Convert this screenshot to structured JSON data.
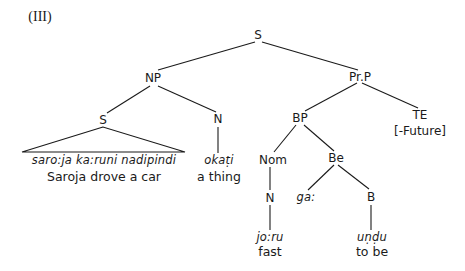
{
  "figure": {
    "label": "(III)",
    "line_color": "#1a1a1a",
    "background": "#ffffff"
  },
  "nodes": {
    "root_s": "S",
    "np": "NP",
    "prp": "Pr.P",
    "sub_s": "S",
    "n_np": "N",
    "bp": "BP",
    "te": "TE",
    "te_feature": "[-Future]",
    "nom": "Nom",
    "be": "Be",
    "n_nom": "N",
    "b": "B"
  },
  "leaves": {
    "clause": {
      "form": "saro:ja ka:runi nadipindi",
      "gloss": "Saroja drove a car"
    },
    "okati": {
      "form": "okaṭi",
      "gloss": "a thing"
    },
    "ga": {
      "form": "ga:"
    },
    "joru": {
      "form": "jo:ru",
      "gloss": "fast"
    },
    "undu": {
      "form": "uṇḍu",
      "gloss": "to be"
    }
  }
}
